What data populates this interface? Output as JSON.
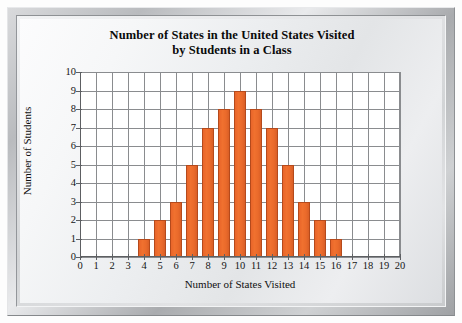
{
  "chart_data": {
    "type": "bar",
    "title": "Number of States in the United States Visited by Students in a Class",
    "title_lines": [
      "Number of States in the United States Visited",
      "by Students in a Class"
    ],
    "xlabel": "Number of States Visited",
    "ylabel": "Number of Students",
    "categories": [
      0,
      1,
      2,
      3,
      4,
      5,
      6,
      7,
      8,
      9,
      10,
      11,
      12,
      13,
      14,
      15,
      16,
      17,
      18,
      19,
      20
    ],
    "values": [
      0,
      0,
      0,
      0,
      1,
      2,
      3,
      5,
      7,
      8,
      9,
      8,
      7,
      5,
      3,
      2,
      1,
      0,
      0,
      0,
      0
    ],
    "xlim": [
      0,
      20
    ],
    "ylim": [
      0,
      10
    ],
    "x_ticks": [
      "0",
      "1",
      "2",
      "3",
      "4",
      "5",
      "6",
      "7",
      "8",
      "9",
      "10",
      "11",
      "12",
      "13",
      "14",
      "15",
      "16",
      "17",
      "18",
      "19",
      "20"
    ],
    "y_ticks": [
      "0",
      "1",
      "2",
      "3",
      "4",
      "5",
      "6",
      "7",
      "8",
      "9",
      "10"
    ],
    "grid": true,
    "legend": null,
    "bar_color": "#ea6a2b",
    "bar_border_color": "#b54a1c",
    "plot_background": "#ffffff",
    "gridline_color": "#8a8c8f",
    "frame_color": "#c9cbcd"
  }
}
